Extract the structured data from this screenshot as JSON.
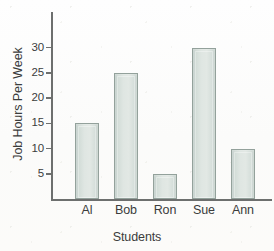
{
  "chart_data": {
    "type": "bar",
    "title": "",
    "categories": [
      "Al",
      "Bob",
      "Ron",
      "Sue",
      "Ann"
    ],
    "values": [
      15,
      25,
      5,
      30,
      10
    ],
    "xlabel": "Students",
    "ylabel": "Job Hours Per Week",
    "ylim": [
      0,
      33
    ],
    "yticks": [
      5,
      10,
      15,
      20,
      25,
      30
    ],
    "ytick_labels": [
      "5",
      "10",
      "15",
      "20",
      "25",
      "30"
    ],
    "grid": false,
    "legend": false,
    "bar_fill_color": "#dde5e1",
    "bar_border_color": "#93a19b",
    "axis_color": "#6d6f6e",
    "text_color": "#3b3c3c",
    "background_color": "#fdfdfc"
  }
}
